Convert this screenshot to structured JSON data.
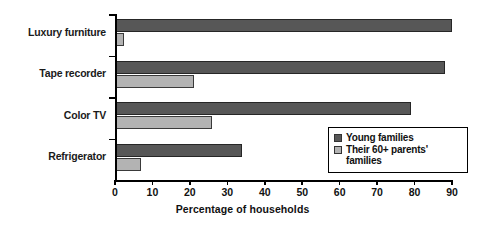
{
  "chart_data": {
    "type": "bar",
    "orientation": "horizontal",
    "title": "",
    "xlabel": "Percentage of households",
    "ylabel": "",
    "xlim": [
      0,
      90
    ],
    "xticks": [
      0,
      10,
      20,
      30,
      40,
      50,
      60,
      70,
      80,
      90
    ],
    "grid": false,
    "legend_position": "inside-lower-right",
    "categories": [
      "Luxury furniture",
      "Tape recorder",
      "Color TV",
      "Refrigerator"
    ],
    "series": [
      {
        "name": "Young families",
        "color": "#575757",
        "values": [
          90,
          88,
          79,
          34
        ]
      },
      {
        "name": "Their 60+ parents' families",
        "color": "#b3b3b3",
        "values": [
          2.5,
          21,
          26,
          7
        ]
      }
    ]
  },
  "legend": {
    "items": [
      {
        "label": "Young families"
      },
      {
        "label": "Their 60+ parents' families"
      }
    ]
  },
  "axis": {
    "title": "Percentage of households"
  }
}
